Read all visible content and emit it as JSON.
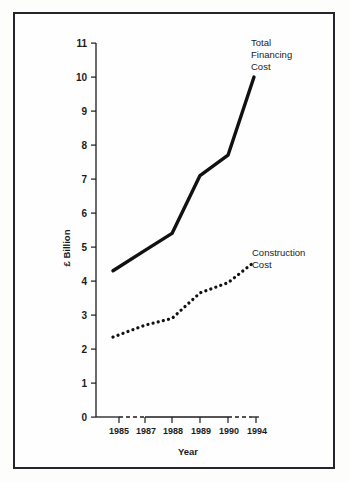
{
  "figure": {
    "background_color": "#fdfdfb",
    "frame_color": "#24242a",
    "ink_color": "#111114"
  },
  "chart_data": {
    "type": "line",
    "title": "",
    "xlabel": "Year",
    "ylabel": "£ Billion",
    "x": [
      "1985",
      "1987",
      "1988",
      "1989",
      "1990",
      "1994"
    ],
    "categories": [
      "1985",
      "1987",
      "1988",
      "1989",
      "1990",
      "1994"
    ],
    "xtick_labels": [
      "1985",
      "1987",
      "1988",
      "1989",
      "1990",
      "1994"
    ],
    "ytick_labels": [
      "0",
      "1",
      "2",
      "3",
      "4",
      "5",
      "6",
      "7",
      "8",
      "9",
      "10",
      "11"
    ],
    "ylim": [
      0,
      11
    ],
    "grid": false,
    "legend_position": "inline-annotation",
    "axis_breaks": [
      "1985-1987",
      "1990-1994"
    ],
    "series": [
      {
        "name": "Total Financing Cost",
        "style": "solid",
        "annotation_lines": [
          "Total",
          "Financing",
          "Cost"
        ],
        "values": [
          4.3,
          4.9,
          5.4,
          7.1,
          7.7,
          10.0
        ]
      },
      {
        "name": "Construction Cost",
        "style": "dotted",
        "annotation_lines": [
          "Construction",
          "Cost"
        ],
        "values": [
          2.35,
          2.7,
          2.9,
          3.65,
          3.95,
          4.55
        ]
      }
    ]
  },
  "annotations": {
    "total_financing": {
      "line1": "Total",
      "line2": "Financing",
      "line3": "Cost"
    },
    "construction": {
      "line1": "Construction",
      "line2": "Cost"
    }
  },
  "axes": {
    "y_title": "£ Billion",
    "x_title": "Year",
    "y_ticks": [
      "11",
      "10",
      "9",
      "8",
      "7",
      "6",
      "5",
      "4",
      "3",
      "2",
      "1",
      "0"
    ],
    "x_ticks": [
      "1985",
      "1987",
      "1988",
      "1989",
      "1990",
      "1994"
    ]
  }
}
